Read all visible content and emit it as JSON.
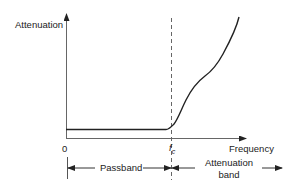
{
  "diagram": {
    "type": "low-pass filter attenuation characteristic",
    "y_axis_label": "Attenuation",
    "x_axis_label": "Frequency",
    "origin_label": "0",
    "cutoff_label_main": "f",
    "cutoff_label_sub": "c",
    "regions": [
      {
        "label": "Passband",
        "from": "0",
        "to": "fc"
      },
      {
        "label_line1": "Attenuation",
        "label_line2": "band",
        "from": "fc",
        "to": "beyond"
      }
    ],
    "colors": {
      "axis": "#555555",
      "curve": "#222222",
      "dashed": "#666666",
      "text": "#222222"
    }
  }
}
